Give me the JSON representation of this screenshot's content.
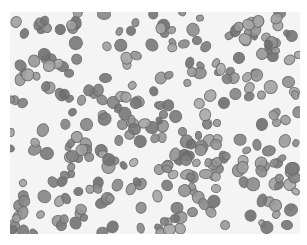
{
  "image": {
    "description": "Grayscale micrograph of a blood smear showing numerous red blood cells",
    "frame": {
      "x": 10,
      "y": 12,
      "width": 290,
      "height": 222
    },
    "background_color": "#f4f4f4",
    "cell_color": "#8a8a8a",
    "cell_edge_color": "#6a6a6a",
    "cell_count_approx": 320,
    "seed": 7
  }
}
